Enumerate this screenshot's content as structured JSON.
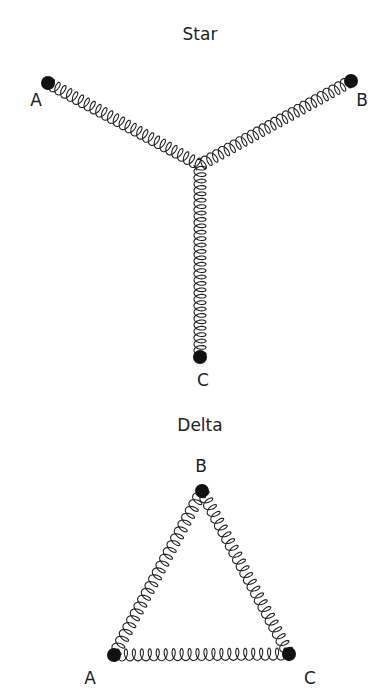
{
  "star": {
    "title": "Star",
    "nodes": {
      "A": {
        "label": "A",
        "x": 48,
        "y": 83,
        "lx": 36,
        "ly": 106
      },
      "B": {
        "label": "B",
        "x": 351,
        "y": 81,
        "lx": 362,
        "ly": 106
      },
      "C": {
        "label": "C",
        "x": 200,
        "y": 357,
        "lx": 203,
        "ly": 386
      }
    },
    "junction": {
      "x": 200,
      "y": 165
    }
  },
  "delta": {
    "title": "Delta",
    "nodes": {
      "A": {
        "label": "A",
        "x": 114,
        "y": 655,
        "lx": 90,
        "ly": 684
      },
      "B": {
        "label": "B",
        "x": 202,
        "y": 491,
        "lx": 201,
        "ly": 472
      },
      "C": {
        "label": "C",
        "x": 289,
        "y": 654,
        "lx": 310,
        "ly": 684
      }
    }
  },
  "colors": {
    "ink": "#111111",
    "spring": "#222222",
    "bg": "#ffffff"
  }
}
